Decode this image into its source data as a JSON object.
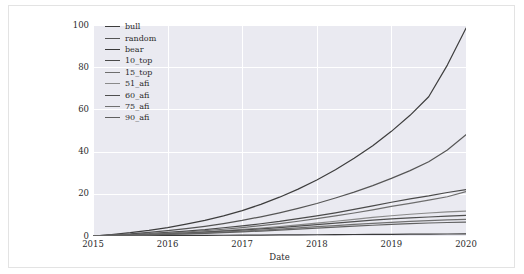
{
  "chart_data": {
    "type": "line",
    "title": "",
    "xlabel": "Date",
    "ylabel": "",
    "xlim": [
      2015,
      2020
    ],
    "ylim": [
      0,
      100
    ],
    "grid": true,
    "legend_position": "upper left",
    "x_ticks": [
      "2015",
      "2016",
      "2017",
      "2018",
      "2019",
      "2020"
    ],
    "y_ticks": [
      "0",
      "20",
      "40",
      "60",
      "80",
      "100"
    ],
    "x": [
      2015.0,
      2015.25,
      2015.5,
      2015.75,
      2016.0,
      2016.25,
      2016.5,
      2016.75,
      2017.0,
      2017.25,
      2017.5,
      2017.75,
      2018.0,
      2018.25,
      2018.5,
      2018.75,
      2019.0,
      2019.25,
      2019.5,
      2019.75,
      2020.0
    ],
    "series": [
      {
        "name": "bull",
        "color": "#3d3d3d",
        "values": [
          0.0,
          0.7,
          1.6,
          2.7,
          4.0,
          5.6,
          7.4,
          9.5,
          12.0,
          15.0,
          18.4,
          22.2,
          26.5,
          31.4,
          36.8,
          42.8,
          49.6,
          57.2,
          66.0,
          81.0,
          98.5
        ]
      },
      {
        "name": "random",
        "color": "#555555",
        "values": [
          0.0,
          0.5,
          1.0,
          1.7,
          2.5,
          3.5,
          4.6,
          5.9,
          7.4,
          9.1,
          11.0,
          13.1,
          15.4,
          18.0,
          20.8,
          23.9,
          27.3,
          31.0,
          35.2,
          40.8,
          48.0
        ]
      },
      {
        "name": "bear",
        "color": "#3a3a3a",
        "values": [
          0.0,
          0.05,
          0.1,
          0.15,
          0.2,
          0.25,
          0.3,
          0.35,
          0.4,
          0.45,
          0.5,
          0.55,
          0.6,
          0.65,
          0.7,
          0.75,
          0.8,
          0.85,
          0.9,
          0.95,
          1.0
        ]
      },
      {
        "name": "10_top",
        "color": "#4a4a4a",
        "values": [
          0.0,
          0.3,
          0.7,
          1.1,
          1.7,
          2.3,
          3.0,
          3.9,
          4.8,
          5.8,
          6.9,
          8.2,
          9.5,
          11.0,
          12.6,
          14.3,
          16.0,
          17.6,
          19.0,
          20.6,
          22.0
        ]
      },
      {
        "name": "15_top",
        "color": "#6e6e6e",
        "values": [
          0.0,
          0.25,
          0.6,
          0.95,
          1.4,
          1.9,
          2.5,
          3.2,
          4.0,
          4.9,
          5.9,
          7.0,
          8.2,
          9.5,
          10.9,
          12.4,
          14.0,
          15.5,
          17.0,
          18.6,
          21.0
        ]
      },
      {
        "name": "51_afi",
        "color": "#8a8a8a",
        "values": [
          0.0,
          0.2,
          0.45,
          0.75,
          1.1,
          1.5,
          2.0,
          2.5,
          3.1,
          3.8,
          4.5,
          5.3,
          6.1,
          7.0,
          7.9,
          8.8,
          9.6,
          10.3,
          10.9,
          11.4,
          11.8
        ]
      },
      {
        "name": "60_afi",
        "color": "#4f4f4f",
        "values": [
          0.0,
          0.18,
          0.4,
          0.68,
          1.0,
          1.38,
          1.8,
          2.28,
          2.8,
          3.4,
          4.0,
          4.7,
          5.4,
          6.1,
          6.8,
          7.5,
          8.1,
          8.6,
          9.0,
          9.4,
          9.8
        ]
      },
      {
        "name": "75_afi",
        "color": "#707070",
        "values": [
          0.0,
          0.15,
          0.35,
          0.58,
          0.85,
          1.15,
          1.5,
          1.9,
          2.35,
          2.8,
          3.3,
          3.85,
          4.4,
          4.95,
          5.5,
          6.0,
          6.5,
          6.9,
          7.3,
          7.6,
          7.9
        ]
      },
      {
        "name": "90_afi",
        "color": "#606060",
        "values": [
          0.0,
          0.12,
          0.28,
          0.47,
          0.7,
          0.95,
          1.25,
          1.58,
          1.95,
          2.35,
          2.8,
          3.25,
          3.7,
          4.2,
          4.65,
          5.1,
          5.5,
          5.85,
          6.15,
          6.4,
          6.6
        ]
      }
    ]
  },
  "legend": {
    "items": [
      {
        "label": "bull"
      },
      {
        "label": "random"
      },
      {
        "label": "bear"
      },
      {
        "label": "10_top"
      },
      {
        "label": "15_top"
      },
      {
        "label": "51_afi"
      },
      {
        "label": "60_afi"
      },
      {
        "label": "75_afi"
      },
      {
        "label": "90_afi"
      }
    ]
  },
  "axes": {
    "x_title": "Date"
  },
  "colors": {
    "plot_background": "#eaeaf1",
    "grid": "#ffffff",
    "figure_background": "#ffffff",
    "frame_border": "#e3e3e3",
    "tick_text": "#2b2b2b"
  }
}
